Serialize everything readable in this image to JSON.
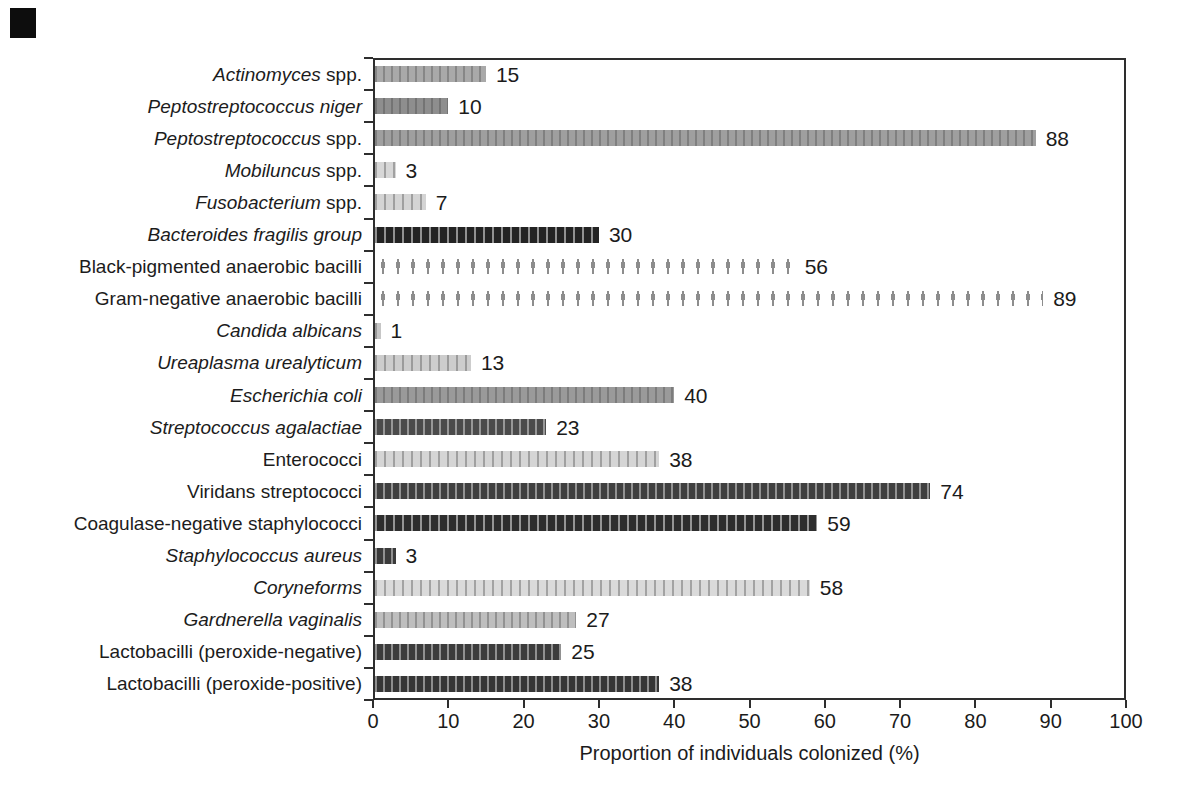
{
  "figure": {
    "corner_mark": "black-square-scan-artifact"
  },
  "palette": {
    "background": "#ffffff",
    "axis": "#2e2e2e",
    "text": "#1b1b1b",
    "artifact": "#0d0d0d"
  },
  "chart_data": {
    "type": "bar",
    "orientation": "horizontal",
    "title": "",
    "xlabel": "Proportion of individuals colonized (%)",
    "ylabel": "",
    "xlim": [
      0,
      100
    ],
    "xticks": [
      "0",
      "10",
      "20",
      "30",
      "40",
      "50",
      "60",
      "70",
      "80",
      "90",
      "100"
    ],
    "grid": false,
    "legend": "none",
    "categories": [
      "Actinomyces spp.",
      "Peptostreptococcus niger",
      "Peptostreptococcus spp.",
      "Mobiluncus spp.",
      "Fusobacterium spp.",
      "Bacteroides fragilis group",
      "Black-pigmented anaerobic bacilli",
      "Gram-negative anaerobic bacilli",
      "Candida albicans",
      "Ureaplasma urealyticum",
      "Escherichia coli",
      "Streptococcus agalactiae",
      "Enterococci",
      "Viridans streptococci",
      "Coagulase-negative staphylococci",
      "Staphylococcus aureus",
      "Coryneforms",
      "Gardnerella vaginalis",
      "Lactobacilli (peroxide-negative)",
      "Lactobacilli (peroxide-positive)"
    ],
    "values": [
      15,
      10,
      88,
      3,
      7,
      30,
      56,
      89,
      1,
      13,
      40,
      23,
      38,
      74,
      59,
      3,
      58,
      27,
      25,
      38
    ],
    "label_parts": [
      [
        [
          "Actinomyces",
          true
        ],
        [
          " spp.",
          false
        ]
      ],
      [
        [
          "Peptostreptococcus niger",
          true
        ]
      ],
      [
        [
          "Peptostreptococcus",
          true
        ],
        [
          " spp.",
          false
        ]
      ],
      [
        [
          "Mobiluncus",
          true
        ],
        [
          " spp.",
          false
        ]
      ],
      [
        [
          "Fusobacterium",
          true
        ],
        [
          " spp.",
          false
        ]
      ],
      [
        [
          "Bacteroides fragilis group",
          true
        ]
      ],
      [
        [
          "Black-pigmented anaerobic bacilli",
          false
        ]
      ],
      [
        [
          "Gram-negative anaerobic bacilli",
          false
        ]
      ],
      [
        [
          "Candida albicans",
          true
        ]
      ],
      [
        [
          "Ureaplasma urealyticum",
          true
        ]
      ],
      [
        [
          "Escherichia coli",
          true
        ]
      ],
      [
        [
          "Streptococcus agalactiae",
          true
        ]
      ],
      [
        [
          "Enterococci",
          false
        ]
      ],
      [
        [
          "Viridans streptococci",
          false
        ]
      ],
      [
        [
          "Coagulase-negative staphylococci",
          false
        ]
      ],
      [
        [
          "Staphylococcus aureus",
          true
        ]
      ],
      [
        [
          "Coryneforms",
          true
        ]
      ],
      [
        [
          "Gardnerella vaginalis",
          true
        ]
      ],
      [
        [
          "Lactobacilli (peroxide-negative)",
          false
        ]
      ],
      [
        [
          "Lactobacilli (peroxide-positive)",
          false
        ]
      ]
    ],
    "bar_styles": [
      "medium",
      "medium",
      "medium",
      "light",
      "light",
      "black",
      "arrows",
      "arrows",
      "light",
      "light",
      "medium",
      "dark",
      "light",
      "dark",
      "black",
      "dark",
      "light",
      "mediumlight",
      "dark",
      "dark"
    ],
    "bar_fills": [
      "#a9a9a9",
      "#8e8e8e",
      "#9f9f9f",
      "#d7d7d7",
      "#d4d4d4",
      "#232323",
      "none",
      "none",
      "#c6c6c6",
      "#cdcdcd",
      "#9a9a9a",
      "#4b4b4b",
      "#d5d5d5",
      "#3f3f3f",
      "#2e2e2e",
      "#3a3a3a",
      "#dadada",
      "#bebebe",
      "#3c3c3c",
      "#363636"
    ]
  }
}
